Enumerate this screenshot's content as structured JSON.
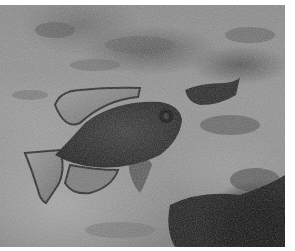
{
  "image": {
    "description": "Grayscale underwater photograph of a damselfish swimming over a rocky, coral-covered seabed, with a second fish partially visible behind a rock on the right",
    "subjects": [
      "damselfish",
      "second-fish",
      "rocky-seabed"
    ],
    "colors": {
      "background_border": "#ffffff",
      "seabed_light": "#a6a6a6",
      "seabed_mid": "#8a8a8a",
      "fish_body": "#2e2e2e",
      "fish_fin_light": "#8c8c8c",
      "shadow": "#0a0a0a"
    }
  }
}
